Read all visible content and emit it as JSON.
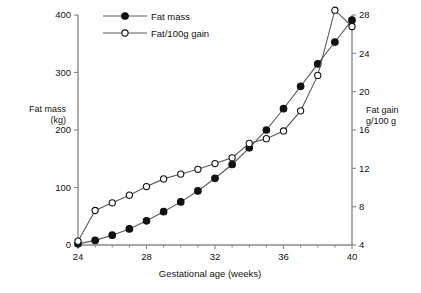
{
  "chart_data": {
    "type": "line",
    "title": "",
    "xlabel": "Gestational age (weeks)",
    "ylabel": "Fat mass (kg)",
    "y2label": "Fat gain g/100 g",
    "xlim": [
      24,
      40
    ],
    "ylim": [
      0,
      400
    ],
    "y2lim": [
      4,
      28
    ],
    "grid": false,
    "legend_position": "top-left",
    "xticks": [
      24,
      28,
      32,
      36,
      40
    ],
    "xticks_minor": [
      25,
      26,
      27,
      29,
      30,
      31,
      33,
      34,
      35,
      37,
      38,
      39
    ],
    "yticks": [
      0,
      100,
      200,
      300,
      400
    ],
    "y2ticks": [
      4,
      8,
      12,
      16,
      20,
      24,
      28
    ],
    "x": [
      24,
      25,
      26,
      27,
      28,
      29,
      30,
      31,
      32,
      33,
      34,
      35,
      36,
      37,
      38,
      39,
      40
    ],
    "series": [
      {
        "name": "Fat mass",
        "axis": "left",
        "marker": "filled-circle",
        "values": [
          2,
          8,
          17,
          28,
          42,
          58,
          75,
          94,
          116,
          140,
          169,
          200,
          237,
          276,
          315,
          353,
          391
        ]
      },
      {
        "name": "Fat/100g gain",
        "axis": "right",
        "marker": "open-circle",
        "values": [
          4.4,
          7.6,
          8.4,
          9.2,
          10.1,
          10.9,
          11.4,
          11.9,
          12.5,
          13.1,
          14.6,
          15.1,
          15.9,
          18.0,
          21.7,
          28.5,
          26.8
        ]
      }
    ]
  },
  "axes": {
    "x_title": "Gestational age (weeks)",
    "y_left_title_line1": "Fat mass",
    "y_left_title_line2": "(kg)",
    "y_right_title_line1": "Fat gain",
    "y_right_title_line2": "g/100 g"
  },
  "legend": {
    "items": [
      {
        "label": "Fat mass",
        "marker": "filled-circle"
      },
      {
        "label": "Fat/100g gain",
        "marker": "open-circle"
      }
    ]
  },
  "colors": {
    "axis": "#8a8a8a",
    "line": "#5a5a5a",
    "marker_fill": "#111111",
    "marker_open_fill": "#ffffff",
    "text": "#111111",
    "background": "#ffffff"
  }
}
